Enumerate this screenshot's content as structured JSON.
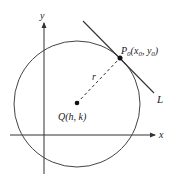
{
  "diagram": {
    "axes": {
      "x_label": "x",
      "y_label": "y"
    },
    "circle": {
      "center_label": "Q(h, k)",
      "radius_label": "r"
    },
    "point": {
      "name": "P",
      "subscript": "0",
      "coords_open": "(x",
      "coords_sub1": "0",
      "coords_mid": ", y",
      "coords_sub2": "0",
      "coords_close": ")"
    },
    "tangent_line": {
      "label": "L"
    },
    "colors": {
      "stroke": "#333333",
      "text": "#1a1a1a",
      "background": "#ffffff"
    }
  }
}
